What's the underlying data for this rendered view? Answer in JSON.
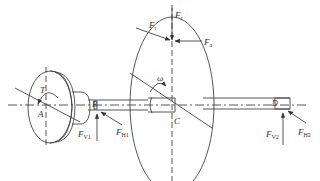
{
  "diagram": {
    "type": "shaft-force-diagram",
    "colors": {
      "stroke": "#444444",
      "text": "#333333",
      "background": "#ffffff"
    },
    "points": {
      "A": "A",
      "B": "B",
      "C": "C",
      "D": "D"
    },
    "torque": {
      "symbol": "T"
    },
    "angular_velocity": {
      "symbol": "ω"
    },
    "forces": {
      "Ft": {
        "main": "F",
        "sub": "t"
      },
      "Fr": {
        "main": "F",
        "sub": "r"
      },
      "Fa": {
        "main": "F",
        "sub": "a"
      },
      "FV1": {
        "main": "F",
        "sub": "V1"
      },
      "FH1": {
        "main": "F",
        "sub": "H1"
      },
      "FV2": {
        "main": "F",
        "sub": "V2"
      },
      "FH2": {
        "main": "F",
        "sub": "H2"
      }
    }
  }
}
